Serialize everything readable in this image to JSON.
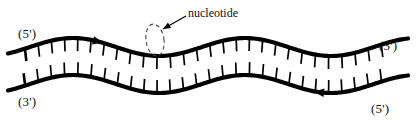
{
  "figure": {
    "background_color": "#ffffff",
    "stroke_color": "#000000",
    "width": 417,
    "height": 121
  },
  "labels": {
    "top_left_end": "(5')",
    "top_right_end": "(3')",
    "bottom_left_end": "(3')",
    "bottom_right_end": "(5')",
    "callout": "nucleotide"
  },
  "icons": {
    "top_strand_direction": "arrowhead-right-icon",
    "bottom_strand_direction": "arrowhead-left-icon",
    "callout_pointer": "leader-arrow-icon",
    "callout_highlight": "dashed-ellipse-icon"
  },
  "strands": [
    {
      "name": "top-strand",
      "label_start": "(5')",
      "label_end": "(3')",
      "direction": "left-to-right",
      "tick_side": "down",
      "tick_count": 28,
      "tick_length": 13,
      "tick_spacing": 13.2,
      "tick_start_x": 25,
      "backbone_width": 4.2,
      "baseline_y": 47,
      "wave_amplitude": 9,
      "wave_phase_x": 30,
      "wave_period": 172,
      "arrow_x": 95
    },
    {
      "name": "bottom-strand",
      "label_start": "(3')",
      "label_end": "(5')",
      "direction": "right-to-left",
      "tick_side": "up",
      "tick_count": 28,
      "tick_length": 13,
      "tick_spacing": 13.2,
      "tick_start_x": 25,
      "backbone_width": 4.2,
      "baseline_y": 84,
      "wave_amplitude": 9,
      "wave_phase_x": 30,
      "wave_period": 172,
      "arrow_x": 322
    }
  ],
  "callout": {
    "text": "nucleotide",
    "ellipse": {
      "cx": 155,
      "cy": 40,
      "rx": 9,
      "ry": 16,
      "rotation": -8
    },
    "pointer": {
      "from_x": 186,
      "from_y": 16,
      "to_x": 163,
      "to_y": 29
    }
  },
  "colors": {
    "ink": "#000000",
    "paper": "#ffffff",
    "text": "#111111"
  }
}
